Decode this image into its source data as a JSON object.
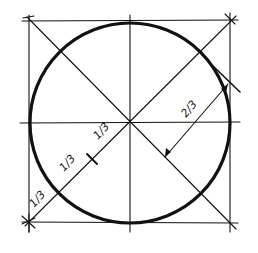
{
  "diagram": {
    "labels": {
      "two_thirds": "2/3",
      "one_third_upper": "1/3",
      "one_third_middle": "1/3",
      "one_third_lower": "1/3"
    },
    "square": {
      "x1": 29,
      "y1": 21,
      "x2": 230,
      "y2": 222
    },
    "circle": {
      "cx": 130,
      "cy": 123,
      "r": 100
    },
    "colors": {
      "ink": "#111111",
      "background": "#ffffff"
    }
  }
}
